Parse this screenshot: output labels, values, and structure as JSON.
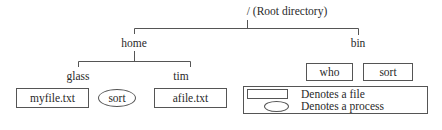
{
  "diagram": {
    "root": {
      "label": "/ (Root directory)"
    },
    "directories": [
      {
        "id": "home",
        "label": "home",
        "children": [
          "glass",
          "tim"
        ]
      },
      {
        "id": "bin",
        "label": "bin",
        "children": [
          "who",
          "sort"
        ]
      },
      {
        "id": "glass",
        "label": "glass",
        "children": [
          "myfile.txt",
          "sort"
        ]
      },
      {
        "id": "tim",
        "label": "tim",
        "children": [
          "afile.txt"
        ]
      }
    ],
    "files": [
      {
        "label": "myfile.txt",
        "parent": "glass"
      },
      {
        "label": "afile.txt",
        "parent": "tim"
      },
      {
        "label": "who",
        "parent": "bin"
      },
      {
        "label": "sort",
        "parent": "bin"
      }
    ],
    "processes": [
      {
        "label": "sort",
        "near": "glass"
      }
    ],
    "legend": {
      "file": "Denotes a file",
      "process": "Denotes a process"
    },
    "colors": {
      "line": "#555555",
      "text": "#2a2a2a",
      "background": "#ffffff"
    }
  }
}
